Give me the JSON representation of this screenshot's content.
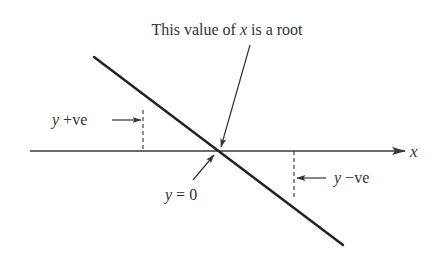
{
  "diagram": {
    "title": "This value of x is a root",
    "title_parts": {
      "pre": "This value of ",
      "var": "x",
      "post": " is a root"
    },
    "axis_label": "x",
    "labels": {
      "positive": {
        "var": "y",
        "text": " +ve"
      },
      "zero": {
        "var": "y",
        "text": " = 0"
      },
      "negative": {
        "var": "y",
        "text": " −ve"
      }
    },
    "colors": {
      "line": "#222222",
      "axis": "#3a3a3a",
      "text": "#333333",
      "background": "#ffffff"
    },
    "geometry": {
      "axis": {
        "x1": 30,
        "x2": 405,
        "y": 151
      },
      "line": {
        "x1": 94,
        "y1": 57,
        "x2": 343,
        "y2": 245
      },
      "root": {
        "x": 218,
        "y": 151
      },
      "dash_positive": {
        "x": 143,
        "y1": 110,
        "y2": 151
      },
      "dash_negative": {
        "x": 294,
        "y1": 151,
        "y2": 200
      }
    }
  }
}
